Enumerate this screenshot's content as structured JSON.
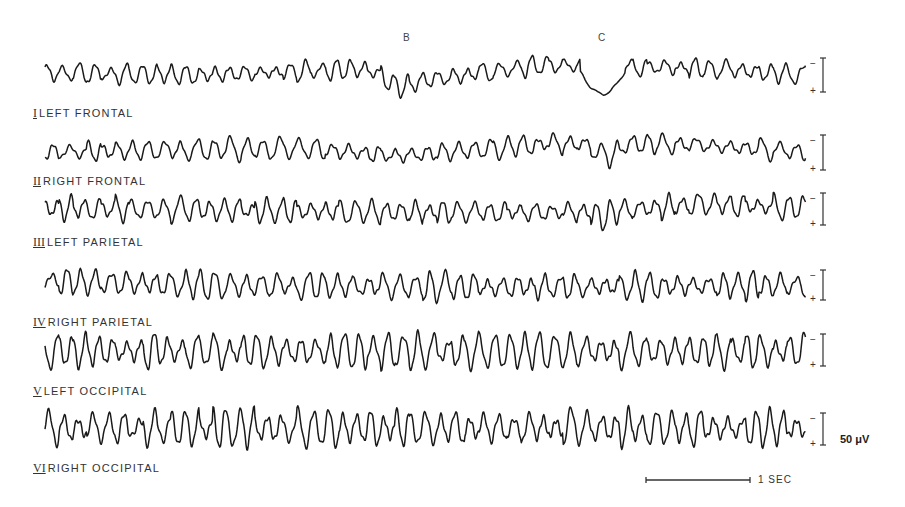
{
  "figure": {
    "type": "EEG recording, six channels",
    "event_markers": [
      {
        "label": "B",
        "x": 406,
        "y": 32
      },
      {
        "label": "C",
        "x": 598,
        "y": 32
      }
    ],
    "calibration": {
      "amplitude_label": "50 μV",
      "time_label": "1 SEC",
      "polarity_minus": "−",
      "polarity_plus": "+"
    }
  },
  "chart_data": {
    "type": "line",
    "title": "",
    "xlabel": "time",
    "ylabel": "voltage",
    "grid": false,
    "legend": "channel labels below each trace, left aligned",
    "scale": {
      "amplitude_bar": "50 μV",
      "time_bar": "1 SEC",
      "time_bar_px": 104
    },
    "annotations": [
      {
        "text": "B",
        "note": "marker above channel I near x=406; slow negative shift / flattening"
      },
      {
        "text": "C",
        "note": "marker above channel I near x=598; large slow deflection (dip) in channels I and II"
      }
    ],
    "series": [
      {
        "name": "I LEFT FRONTAL",
        "numeral": "I",
        "label": "LEFT FRONTAL",
        "baseline_y": 73,
        "label_y": 106,
        "bar_y": [
          58,
          92
        ],
        "amp": 9,
        "freq_px": 15.5,
        "seed": 1,
        "events": [
          {
            "x0": 378,
            "x1": 420,
            "shift": 12
          },
          {
            "x0": 580,
            "x1": 625,
            "shift": 22,
            "smooth": true
          }
        ],
        "drift": [
          {
            "x": 45,
            "dy": 0
          },
          {
            "x": 200,
            "dy": 2
          },
          {
            "x": 360,
            "dy": -4
          },
          {
            "x": 420,
            "dy": 8
          },
          {
            "x": 540,
            "dy": -8
          },
          {
            "x": 700,
            "dy": -5
          },
          {
            "x": 805,
            "dy": 2
          }
        ]
      },
      {
        "name": "II RIGHT FRONTAL",
        "numeral": "II",
        "label": "RIGHT FRONTAL",
        "baseline_y": 150,
        "label_y": 174,
        "bar_y": [
          135,
          170
        ],
        "amp": 10,
        "freq_px": 16,
        "seed": 2,
        "events": [
          {
            "x0": 590,
            "x1": 625,
            "shift": 16
          }
        ],
        "drift": [
          {
            "x": 45,
            "dy": 2
          },
          {
            "x": 300,
            "dy": -2
          },
          {
            "x": 400,
            "dy": 6
          },
          {
            "x": 540,
            "dy": -6
          },
          {
            "x": 680,
            "dy": -6
          },
          {
            "x": 805,
            "dy": 2
          }
        ]
      },
      {
        "name": "III LEFT PARIETAL",
        "numeral": "III",
        "label": "LEFT PARIETAL",
        "baseline_y": 208,
        "label_y": 235,
        "bar_y": [
          193,
          225
        ],
        "amp": 11,
        "freq_px": 15,
        "seed": 3,
        "events": [
          {
            "x0": 592,
            "x1": 612,
            "shift": 8
          }
        ],
        "drift": [
          {
            "x": 45,
            "dy": 0
          },
          {
            "x": 400,
            "dy": 4
          },
          {
            "x": 600,
            "dy": 4
          },
          {
            "x": 700,
            "dy": -4
          },
          {
            "x": 805,
            "dy": 0
          }
        ]
      },
      {
        "name": "IV RIGHT PARIETAL",
        "numeral": "IV",
        "label": "RIGHT PARIETAL",
        "baseline_y": 285,
        "label_y": 315,
        "bar_y": [
          270,
          300
        ],
        "amp": 13,
        "freq_px": 15,
        "seed": 4,
        "events": [],
        "drift": [
          {
            "x": 45,
            "dy": -4
          },
          {
            "x": 200,
            "dy": 0
          },
          {
            "x": 500,
            "dy": 2
          },
          {
            "x": 805,
            "dy": 0
          }
        ]
      },
      {
        "name": "V LEFT OCCIPITAL",
        "numeral": "V",
        "label": "LEFT OCCIPITAL",
        "baseline_y": 351,
        "label_y": 384,
        "bar_y": [
          334,
          366
        ],
        "amp": 16,
        "freq_px": 14.5,
        "seed": 5,
        "events": [],
        "drift": [
          {
            "x": 45,
            "dy": 0
          },
          {
            "x": 805,
            "dy": 0
          }
        ]
      },
      {
        "name": "VI RIGHT OCCIPITAL",
        "numeral": "VI",
        "label": "RIGHT OCCIPITAL",
        "baseline_y": 428,
        "label_y": 461,
        "bar_y": [
          413,
          445
        ],
        "amp": 17,
        "freq_px": 14.5,
        "seed": 6,
        "events": [],
        "drift": [
          {
            "x": 45,
            "dy": 0
          },
          {
            "x": 805,
            "dy": 0
          }
        ]
      }
    ],
    "x_range_px": [
      45,
      806
    ],
    "time_bar_px": [
      646,
      750,
      480
    ]
  }
}
